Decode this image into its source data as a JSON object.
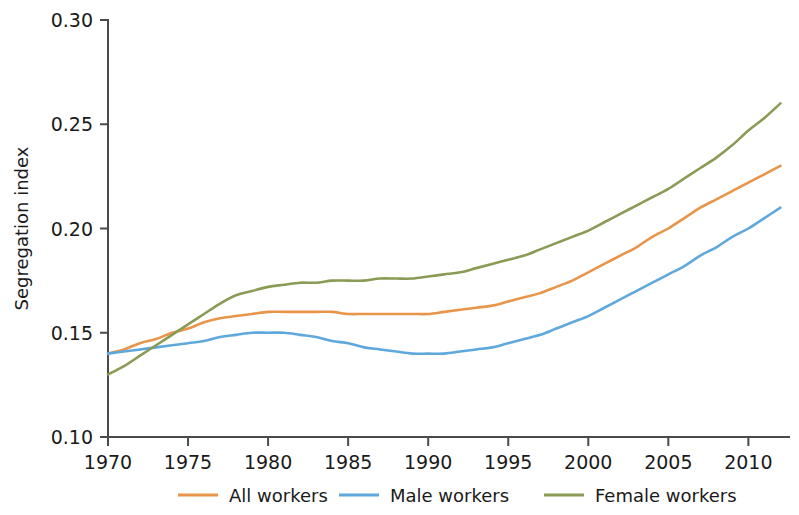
{
  "chart_data": {
    "type": "line",
    "title": "",
    "xlabel": "",
    "ylabel": "Segregation index",
    "xlim": [
      1970,
      2012.6
    ],
    "ylim": [
      0.1,
      0.3
    ],
    "grid": false,
    "legend_position": "bottom",
    "x_ticks": [
      1970,
      1975,
      1980,
      1985,
      1990,
      1995,
      2000,
      2005,
      2010
    ],
    "x_tick_labels": [
      "1970",
      "1975",
      "1980",
      "1985",
      "1990",
      "1995",
      "2000",
      "2005",
      "2010"
    ],
    "y_ticks": [
      0.1,
      0.15,
      0.2,
      0.25,
      0.3
    ],
    "y_tick_labels": [
      "0.10",
      "0.15",
      "0.20",
      "0.25",
      "0.30"
    ],
    "x": [
      1970,
      1971,
      1972,
      1973,
      1974,
      1975,
      1976,
      1977,
      1978,
      1979,
      1980,
      1981,
      1982,
      1983,
      1984,
      1985,
      1986,
      1987,
      1988,
      1989,
      1990,
      1991,
      1992,
      1993,
      1994,
      1995,
      1996,
      1997,
      1998,
      1999,
      2000,
      2001,
      2002,
      2003,
      2004,
      2005,
      2006,
      2007,
      2008,
      2009,
      2010,
      2011,
      2012
    ],
    "series": [
      {
        "name": "All workers",
        "color": "#E8954A",
        "values": [
          0.14,
          0.142,
          0.145,
          0.147,
          0.15,
          0.152,
          0.155,
          0.157,
          0.158,
          0.159,
          0.16,
          0.16,
          0.16,
          0.16,
          0.16,
          0.159,
          0.159,
          0.159,
          0.159,
          0.159,
          0.159,
          0.16,
          0.161,
          0.162,
          0.163,
          0.165,
          0.167,
          0.169,
          0.172,
          0.175,
          0.179,
          0.183,
          0.187,
          0.191,
          0.196,
          0.2,
          0.205,
          0.21,
          0.214,
          0.218,
          0.222,
          0.226,
          0.23
        ]
      },
      {
        "name": "Male workers",
        "color": "#5FA8DC",
        "values": [
          0.14,
          0.141,
          0.142,
          0.143,
          0.144,
          0.145,
          0.146,
          0.148,
          0.149,
          0.15,
          0.15,
          0.15,
          0.149,
          0.148,
          0.146,
          0.145,
          0.143,
          0.142,
          0.141,
          0.14,
          0.14,
          0.14,
          0.141,
          0.142,
          0.143,
          0.145,
          0.147,
          0.149,
          0.152,
          0.155,
          0.158,
          0.162,
          0.166,
          0.17,
          0.174,
          0.178,
          0.182,
          0.187,
          0.191,
          0.196,
          0.2,
          0.205,
          0.21
        ]
      },
      {
        "name": "Female workers",
        "color": "#8A9B55",
        "values": [
          0.13,
          0.134,
          0.139,
          0.144,
          0.149,
          0.154,
          0.159,
          0.164,
          0.168,
          0.17,
          0.172,
          0.173,
          0.174,
          0.174,
          0.175,
          0.175,
          0.175,
          0.176,
          0.176,
          0.176,
          0.177,
          0.178,
          0.179,
          0.181,
          0.183,
          0.185,
          0.187,
          0.19,
          0.193,
          0.196,
          0.199,
          0.203,
          0.207,
          0.211,
          0.215,
          0.219,
          0.224,
          0.229,
          0.234,
          0.24,
          0.247,
          0.253,
          0.26
        ]
      }
    ]
  },
  "axis": {
    "y_title": "Segregation index"
  },
  "legend": {
    "items": [
      {
        "label": "All workers",
        "color": "#E8954A"
      },
      {
        "label": "Male workers",
        "color": "#5FA8DC"
      },
      {
        "label": "Female workers",
        "color": "#8A9B55"
      }
    ]
  }
}
